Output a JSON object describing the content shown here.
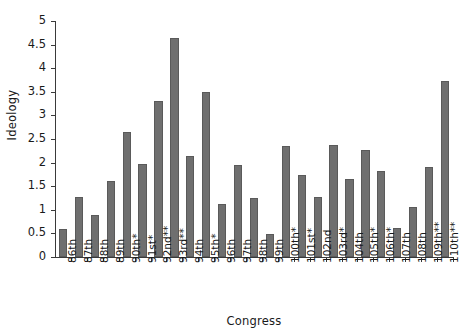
{
  "chart_data": {
    "type": "bar",
    "title": "",
    "xlabel": "Congress",
    "ylabel": "Ideology",
    "ylim": [
      0,
      5
    ],
    "ytick_values": [
      0,
      0.5,
      1,
      1.5,
      2,
      2.5,
      3,
      3.5,
      4,
      4.5,
      5
    ],
    "ytick_labels": [
      "0",
      "0.5",
      "1",
      "1.5",
      "2",
      "2.5",
      "3",
      "3.5",
      "4",
      "4.5",
      "5"
    ],
    "grid": false,
    "legend": null,
    "bar_color": "#6f6f6f",
    "bar_edge_color": "#5a5a5a",
    "axis_color": "#3a3a3a",
    "categories": [
      "86th",
      "87th",
      "88th",
      "89th",
      "90th*",
      "91st*",
      "92nd**",
      "93rd**",
      "94th",
      "95th*",
      "96th",
      "97th",
      "98th",
      "99th",
      "100th*",
      "101st*",
      "102nd",
      "103rd*",
      "104th",
      "105th*",
      "106th*",
      "107th",
      "108th",
      "109th**",
      "110th**"
    ],
    "values": [
      0.6,
      1.28,
      0.9,
      1.6,
      2.65,
      1.98,
      3.3,
      4.65,
      2.15,
      3.5,
      1.13,
      1.95,
      1.25,
      0.48,
      2.35,
      1.73,
      1.27,
      2.37,
      1.65,
      2.27,
      1.82,
      0.62,
      1.05,
      1.9,
      3.72
    ]
  }
}
